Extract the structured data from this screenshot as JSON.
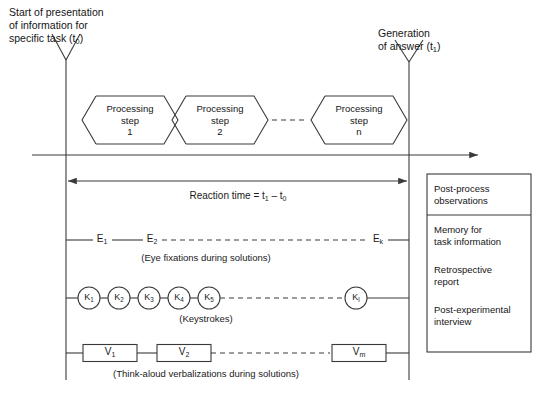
{
  "diagram": {
    "headers": {
      "start": "Start of presentation\nof information for\nspecific task (t0)",
      "start_line1": "Start of presentation",
      "start_line2": "of information for",
      "start_line3_pre": "specific task (t",
      "start_line3_sub": "0",
      "start_line3_post": ")",
      "end_line1": "Generation",
      "end_line2_pre": "of answer (t",
      "end_line2_sub": "1",
      "end_line2_post": ")"
    },
    "processing_steps": [
      {
        "line1": "Processing",
        "line2": "step",
        "line3": "1"
      },
      {
        "line1": "Processing",
        "line2": "step",
        "line3": "2"
      },
      {
        "line1": "Processing",
        "line2": "step",
        "line3": "n"
      }
    ],
    "reaction_time": {
      "prefix": "Reaction time = t",
      "sub1": "1",
      "middle": " – t",
      "sub2": "0"
    },
    "rows": [
      {
        "id": "eye-fixations",
        "caption": "(Eye fixations during solutions)",
        "node_shape": "text",
        "nodes": [
          {
            "base": "E",
            "sub": "1"
          },
          {
            "base": "E",
            "sub": "2"
          },
          {
            "base": "E",
            "sub": "k"
          }
        ]
      },
      {
        "id": "keystrokes",
        "caption": "(Keystrokes)",
        "node_shape": "circle",
        "nodes": [
          {
            "base": "K",
            "sub": "1"
          },
          {
            "base": "K",
            "sub": "2"
          },
          {
            "base": "K",
            "sub": "3"
          },
          {
            "base": "K",
            "sub": "4"
          },
          {
            "base": "K",
            "sub": "5"
          },
          {
            "base": "K",
            "sub": "l"
          }
        ]
      },
      {
        "id": "verbalizations",
        "caption": "(Think-aloud verbalizations during solutions)",
        "node_shape": "rect",
        "nodes": [
          {
            "base": "V",
            "sub": "1"
          },
          {
            "base": "V",
            "sub": "2"
          },
          {
            "base": "V",
            "sub": "m"
          }
        ]
      }
    ],
    "post_process_panel": {
      "header_line1": "Post-process",
      "header_line2": "observations",
      "items": [
        {
          "line1": "Memory for",
          "line2": "task information"
        },
        {
          "line1": "Retrospective",
          "line2": "report"
        },
        {
          "line1": "Post-experimental",
          "line2": "interview"
        }
      ]
    },
    "colors": {
      "stroke": "#3a3a3a",
      "text": "#151515",
      "background": "#ffffff"
    }
  }
}
